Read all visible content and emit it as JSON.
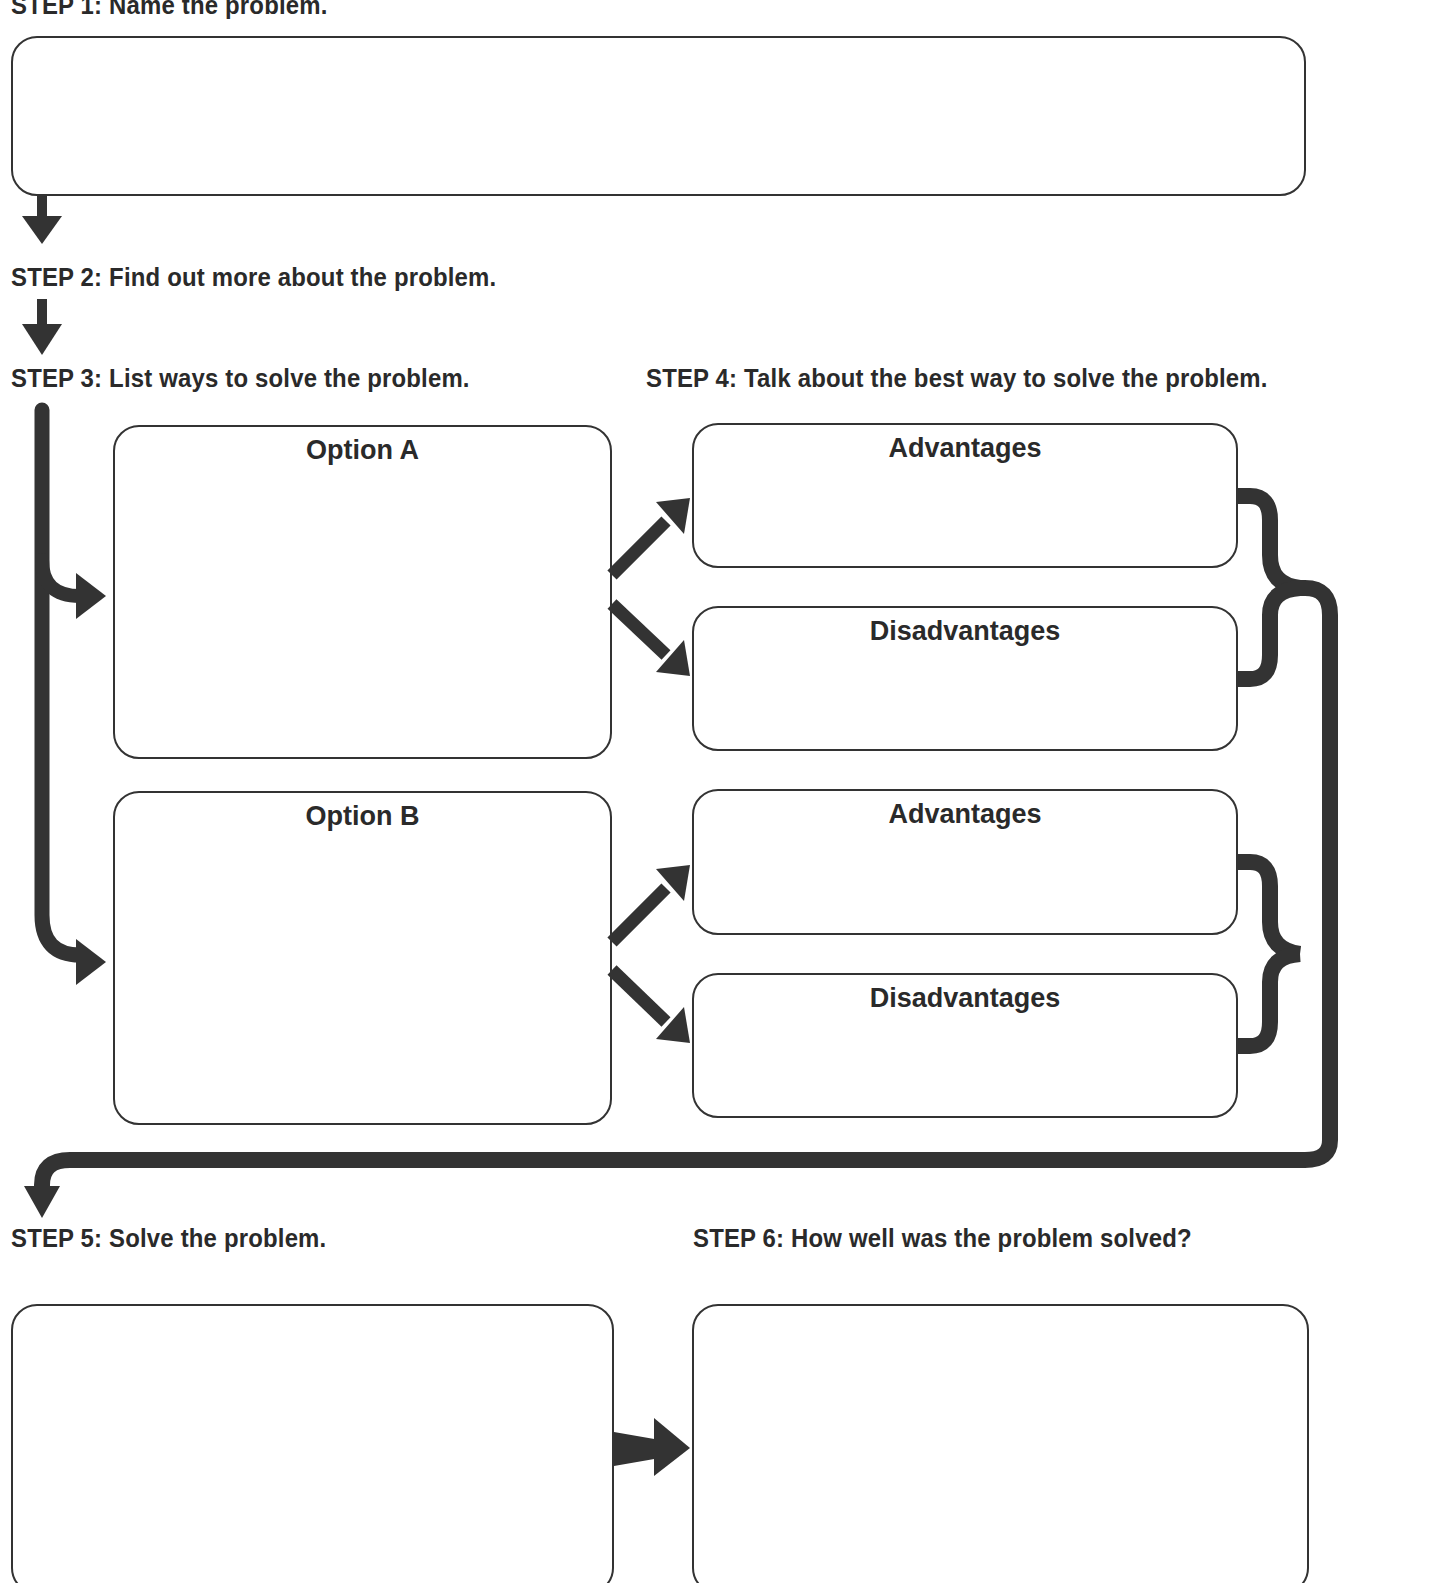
{
  "steps": {
    "step1": {
      "num": "STEP 1:",
      "text": "Name the problem."
    },
    "step2": {
      "num": "STEP 2:",
      "text": "Find out more about the problem."
    },
    "step3": {
      "num": "STEP 3:",
      "text": "List ways to solve the problem."
    },
    "step4": {
      "num": "STEP 4:",
      "text": "Talk about the best way to solve the problem."
    },
    "step5": {
      "num": "STEP 5:",
      "text": "Solve the problem."
    },
    "step6": {
      "num": "STEP 6:",
      "text": "How well was the problem solved?"
    }
  },
  "boxes": {
    "problem": {
      "value": ""
    },
    "option_a": {
      "title": "Option A",
      "value": ""
    },
    "option_a_advantages": {
      "title": "Advantages",
      "value": ""
    },
    "option_a_disadvantages": {
      "title": "Disadvantages",
      "value": ""
    },
    "option_b": {
      "title": "Option B",
      "value": ""
    },
    "option_b_advantages": {
      "title": "Advantages",
      "value": ""
    },
    "option_b_disadvantages": {
      "title": "Disadvantages",
      "value": ""
    },
    "solve": {
      "value": ""
    },
    "evaluation": {
      "value": ""
    }
  },
  "colors": {
    "arrow": "#333333",
    "border": "#333333",
    "text": "#2a2a2a"
  }
}
